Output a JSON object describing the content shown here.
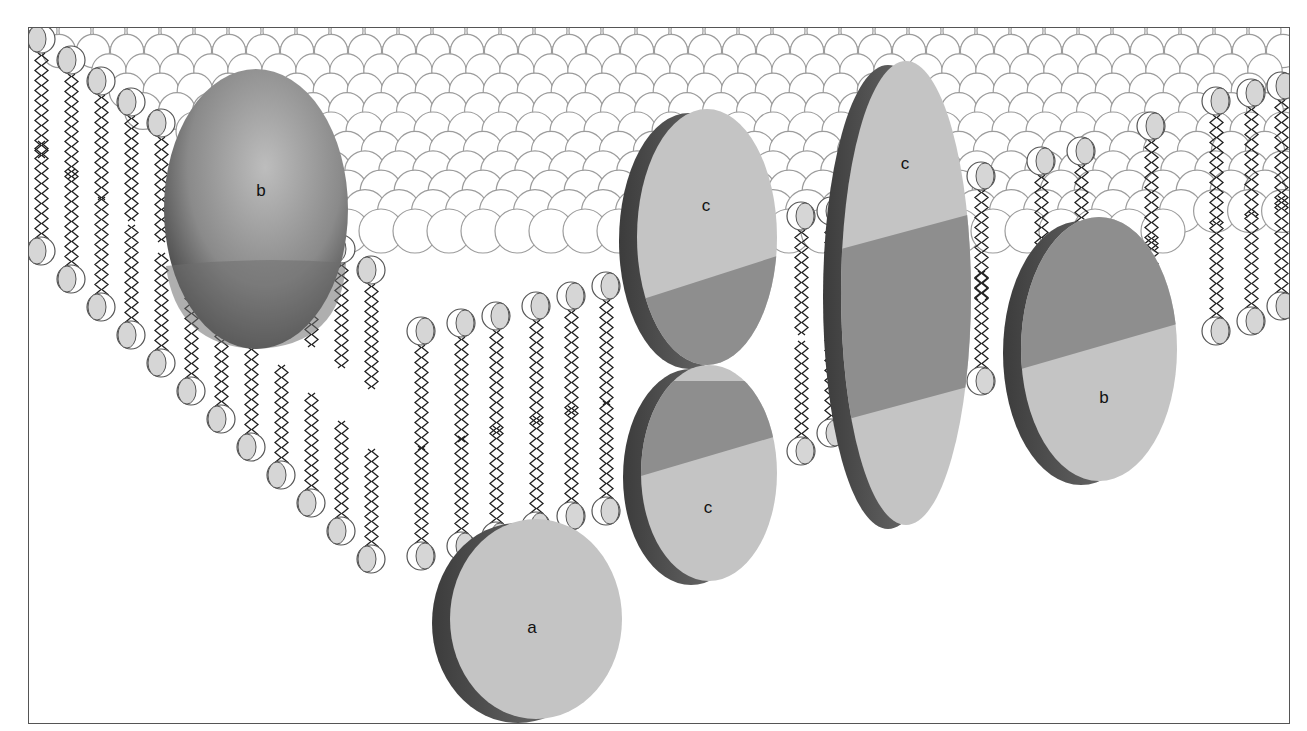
{
  "diagram": {
    "type": "fluid-mosaic membrane model (lipid bilayer with membrane proteins)",
    "colors": {
      "head_fill": "#d6d6d6",
      "head_shadow": "#9a9a9a",
      "head_outline": "#555555",
      "protein_face": "#c4c4c4",
      "protein_band": "#8e8e8e",
      "protein_side": "#5e5e5e",
      "background": "#ffffff"
    },
    "proteins": [
      {
        "id": "b-left",
        "label": "b",
        "x": 261,
        "y": 191,
        "kind": "integral globular (sphere)"
      },
      {
        "id": "c-top",
        "label": "c",
        "x": 706,
        "y": 206,
        "kind": "half-protein, upper leaflet"
      },
      {
        "id": "c-tall",
        "label": "c",
        "x": 905,
        "y": 164,
        "kind": "transmembrane"
      },
      {
        "id": "c-bottom",
        "label": "c",
        "x": 708,
        "y": 508,
        "kind": "half-protein, lower leaflet"
      },
      {
        "id": "b-right",
        "label": "b",
        "x": 1104,
        "y": 398,
        "kind": "transmembrane"
      },
      {
        "id": "a",
        "label": "a",
        "x": 532,
        "y": 628,
        "kind": "peripheral"
      }
    ]
  }
}
